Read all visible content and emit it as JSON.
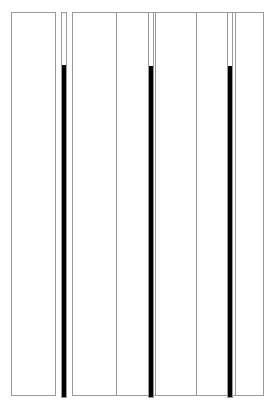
{
  "figure": {
    "type": "schematic",
    "canvas_width_px": 274,
    "canvas_height_px": 408,
    "background_color": "#ffffff",
    "outline_color": "#9a9a9a",
    "fill_color": "#000000"
  },
  "chart_data": {
    "type": "bar",
    "title": "",
    "subtitle": "",
    "xlabel": "",
    "ylabel": "",
    "grid": false,
    "legend": null,
    "orientation": "vertical",
    "baseline": "bottom",
    "axis_top_px": 12,
    "axis_bottom_px": 398,
    "categories": [
      "G1",
      "G2",
      "G3",
      "G4",
      "G5",
      "G6",
      "G7"
    ],
    "tick_labels": [],
    "ylim": [
      0,
      100
    ],
    "series": [
      {
        "name": "fill level",
        "values": [
          0,
          86,
          0,
          86,
          0,
          86,
          0
        ]
      }
    ],
    "annotations": []
  },
  "left_group": {
    "label": "left-standalone-panel",
    "panel": {
      "name": "left-panel",
      "x": 11,
      "y": 12,
      "width": 45,
      "height": 384,
      "filled": false
    },
    "gauges": [
      {
        "name": "gauge-1",
        "x": 61,
        "y": 12,
        "width": 6,
        "height": 386,
        "fill_start_y": 65,
        "fill_value_pct": 86
      }
    ]
  },
  "right_group": {
    "label": "right-composite-panel",
    "panel": {
      "name": "right-panel",
      "x": 72,
      "y": 12,
      "width": 192,
      "height": 384,
      "filled": false
    },
    "dividers": [
      {
        "name": "divider-1",
        "x": 116
      },
      {
        "name": "divider-2",
        "x": 155
      },
      {
        "name": "divider-3",
        "x": 196
      },
      {
        "name": "divider-4",
        "x": 235
      }
    ],
    "gauges": [
      {
        "name": "gauge-2",
        "x": 148,
        "y": 12,
        "width": 6,
        "height": 386,
        "fill_start_y": 66,
        "fill_value_pct": 86
      },
      {
        "name": "gauge-3",
        "x": 227,
        "y": 12,
        "width": 6,
        "height": 386,
        "fill_start_y": 66,
        "fill_value_pct": 86
      }
    ]
  }
}
